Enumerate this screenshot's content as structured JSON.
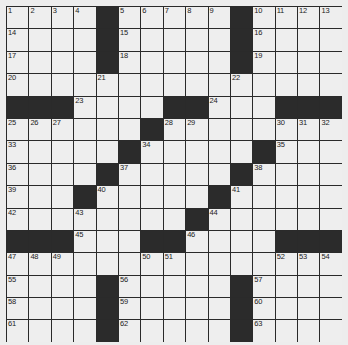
{
  "puzzle": {
    "size": 15,
    "rows": [
      ".... ..... ....",
      ".... ..... ....",
      ".... ..... ....",
      "...............",
      "###....##...###",
      "......#........",
      ".....#.....#...",
      "....#.....#....",
      "...#.....#.....",
      "........#......",
      "###....##...###",
      "...............",
      ".... ..... ....",
      ".... ..... ....",
      ".... ..... ...."
    ],
    "black_cells": [
      [
        0,
        4
      ],
      [
        0,
        10
      ],
      [
        1,
        4
      ],
      [
        1,
        10
      ],
      [
        2,
        4
      ],
      [
        2,
        10
      ],
      [
        4,
        0
      ],
      [
        4,
        1
      ],
      [
        4,
        2
      ],
      [
        4,
        7
      ],
      [
        4,
        8
      ],
      [
        4,
        12
      ],
      [
        4,
        13
      ],
      [
        4,
        14
      ],
      [
        5,
        6
      ],
      [
        6,
        5
      ],
      [
        6,
        11
      ],
      [
        7,
        4
      ],
      [
        7,
        10
      ],
      [
        8,
        3
      ],
      [
        8,
        9
      ],
      [
        9,
        8
      ],
      [
        10,
        0
      ],
      [
        10,
        1
      ],
      [
        10,
        2
      ],
      [
        10,
        6
      ],
      [
        10,
        7
      ],
      [
        10,
        12
      ],
      [
        10,
        13
      ],
      [
        10,
        14
      ],
      [
        12,
        4
      ],
      [
        12,
        10
      ],
      [
        13,
        4
      ],
      [
        13,
        10
      ],
      [
        14,
        4
      ],
      [
        14,
        10
      ]
    ],
    "numbers": [
      {
        "r": 0,
        "c": 0,
        "n": "1"
      },
      {
        "r": 0,
        "c": 1,
        "n": "2"
      },
      {
        "r": 0,
        "c": 2,
        "n": "3"
      },
      {
        "r": 0,
        "c": 3,
        "n": "4"
      },
      {
        "r": 0,
        "c": 5,
        "n": "5"
      },
      {
        "r": 0,
        "c": 6,
        "n": "6"
      },
      {
        "r": 0,
        "c": 7,
        "n": "7"
      },
      {
        "r": 0,
        "c": 8,
        "n": "8"
      },
      {
        "r": 0,
        "c": 9,
        "n": "9"
      },
      {
        "r": 0,
        "c": 11,
        "n": "10"
      },
      {
        "r": 0,
        "c": 12,
        "n": "11"
      },
      {
        "r": 0,
        "c": 13,
        "n": "12"
      },
      {
        "r": 0,
        "c": 14,
        "n": "13"
      },
      {
        "r": 1,
        "c": 0,
        "n": "14"
      },
      {
        "r": 1,
        "c": 5,
        "n": "15"
      },
      {
        "r": 1,
        "c": 11,
        "n": "16"
      },
      {
        "r": 2,
        "c": 0,
        "n": "17"
      },
      {
        "r": 2,
        "c": 5,
        "n": "18"
      },
      {
        "r": 2,
        "c": 11,
        "n": "19"
      },
      {
        "r": 3,
        "c": 0,
        "n": "20"
      },
      {
        "r": 3,
        "c": 4,
        "n": "21"
      },
      {
        "r": 3,
        "c": 10,
        "n": "22"
      },
      {
        "r": 4,
        "c": 3,
        "n": "23"
      },
      {
        "r": 4,
        "c": 9,
        "n": "24"
      },
      {
        "r": 5,
        "c": 0,
        "n": "25"
      },
      {
        "r": 5,
        "c": 1,
        "n": "26"
      },
      {
        "r": 5,
        "c": 2,
        "n": "27"
      },
      {
        "r": 5,
        "c": 7,
        "n": "28"
      },
      {
        "r": 5,
        "c": 8,
        "n": "29"
      },
      {
        "r": 5,
        "c": 12,
        "n": "30"
      },
      {
        "r": 5,
        "c": 13,
        "n": "31"
      },
      {
        "r": 5,
        "c": 14,
        "n": "32"
      },
      {
        "r": 6,
        "c": 0,
        "n": "33"
      },
      {
        "r": 6,
        "c": 6,
        "n": "34"
      },
      {
        "r": 6,
        "c": 12,
        "n": "35"
      },
      {
        "r": 7,
        "c": 0,
        "n": "36"
      },
      {
        "r": 7,
        "c": 5,
        "n": "37"
      },
      {
        "r": 7,
        "c": 11,
        "n": "38"
      },
      {
        "r": 8,
        "c": 0,
        "n": "39"
      },
      {
        "r": 8,
        "c": 4,
        "n": "40"
      },
      {
        "r": 8,
        "c": 10,
        "n": "41"
      },
      {
        "r": 9,
        "c": 0,
        "n": "42"
      },
      {
        "r": 9,
        "c": 3,
        "n": "43"
      },
      {
        "r": 9,
        "c": 9,
        "n": "44"
      },
      {
        "r": 10,
        "c": 3,
        "n": "45"
      },
      {
        "r": 10,
        "c": 8,
        "n": "46"
      },
      {
        "r": 11,
        "c": 0,
        "n": "47"
      },
      {
        "r": 11,
        "c": 1,
        "n": "48"
      },
      {
        "r": 11,
        "c": 2,
        "n": "49"
      },
      {
        "r": 11,
        "c": 6,
        "n": "50"
      },
      {
        "r": 11,
        "c": 7,
        "n": "51"
      },
      {
        "r": 11,
        "c": 12,
        "n": "52"
      },
      {
        "r": 11,
        "c": 13,
        "n": "53"
      },
      {
        "r": 11,
        "c": 14,
        "n": "54"
      },
      {
        "r": 12,
        "c": 0,
        "n": "55"
      },
      {
        "r": 12,
        "c": 5,
        "n": "56"
      },
      {
        "r": 12,
        "c": 11,
        "n": "57"
      },
      {
        "r": 13,
        "c": 0,
        "n": "58"
      },
      {
        "r": 13,
        "c": 5,
        "n": "59"
      },
      {
        "r": 13,
        "c": 11,
        "n": "60"
      },
      {
        "r": 14,
        "c": 0,
        "n": "61"
      },
      {
        "r": 14,
        "c": 5,
        "n": "62"
      },
      {
        "r": 14,
        "c": 11,
        "n": "63"
      }
    ]
  },
  "colors": {
    "background": "#ededed",
    "cell_white": "#eeeeee",
    "cell_black": "#2b2b2b",
    "grid_line": "#2a2a2a"
  }
}
